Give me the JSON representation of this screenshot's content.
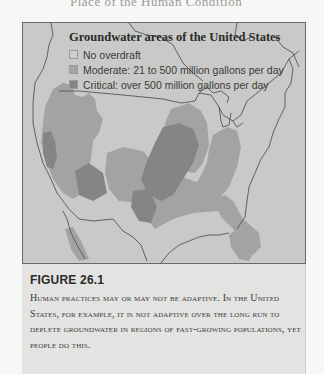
{
  "page": {
    "top_fragment": "Place of the Human Condition"
  },
  "figure": {
    "legend": {
      "title": "Groundwater areas of the United States",
      "items": [
        {
          "label": "No overdraft",
          "color": "#cfcfcd"
        },
        {
          "label": "Moderate: 21 to 500 million gallons per day",
          "color": "#a3a3a1"
        },
        {
          "label": "Critical: over 500 million gallons per day",
          "color": "#858583"
        }
      ]
    },
    "map": {
      "background_color": "#c9c9c7",
      "border_line_color": "#555555"
    },
    "number": "FIGURE 26.1",
    "caption": "Human practices may or may not be adaptive. In the United States, for example, it is not adaptive over the long run to deplete groundwater in regions of fast-growing populations, yet people do this."
  }
}
